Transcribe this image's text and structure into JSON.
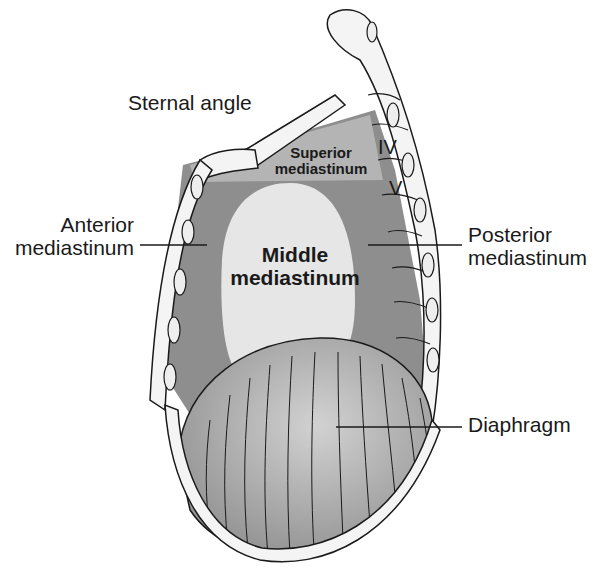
{
  "diagram": {
    "colors": {
      "background": "#ffffff",
      "superior_region": "#b4b4b4",
      "anterior_posterior_region": "#8e8e8e",
      "middle_region": "#e6e6e6",
      "diaphragm": "#a9a9a9",
      "bone": "#f4f4f4",
      "outline": "#1a1a1a"
    },
    "labels": {
      "sternal_angle": "Sternal angle",
      "superior_line1": "Superior",
      "superior_line2": "mediastinum",
      "anterior_line1": "Anterior",
      "anterior_line2": "mediastinum",
      "middle_line1": "Middle",
      "middle_line2": "mediastinum",
      "posterior_line1": "Posterior",
      "posterior_line2": "mediastinum",
      "diaphragm": "Diaphragm",
      "vertebra_iv": "IV",
      "vertebra_v": "V"
    }
  }
}
